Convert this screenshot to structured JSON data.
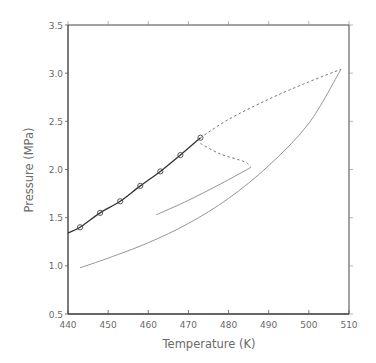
{
  "chart_data": {
    "type": "line",
    "title": "",
    "xlabel": "Temperature (K)",
    "ylabel": "Pressure (MPa)",
    "xlim": [
      440,
      510
    ],
    "ylim": [
      0.5,
      3.5
    ],
    "xticks": [
      440,
      450,
      460,
      470,
      480,
      490,
      500,
      510
    ],
    "yticks": [
      0.5,
      1.0,
      1.5,
      2.0,
      2.5,
      3.0,
      3.5
    ],
    "xtick_labels": [
      "440",
      "450",
      "460",
      "470",
      "480",
      "490",
      "500",
      "510"
    ],
    "ytick_labels": [
      "0.5",
      "1.0",
      "1.5",
      "2.0",
      "2.5",
      "3.0",
      "3.5"
    ],
    "grid": false,
    "legend": null,
    "series": [
      {
        "name": "vapor pressure curve (measured)",
        "style": "solid-thick-with-circle-markers",
        "markers": {
          "x": [
            443,
            448,
            453,
            458,
            463,
            468,
            473
          ],
          "y": [
            1.4,
            1.55,
            1.67,
            1.83,
            1.98,
            2.15,
            2.33
          ]
        },
        "line": {
          "x": [
            440,
            443,
            448,
            453,
            458,
            463,
            468,
            473
          ],
          "y": [
            1.34,
            1.4,
            1.55,
            1.67,
            1.83,
            1.98,
            2.15,
            2.33
          ]
        }
      },
      {
        "name": "upper extrapolation (dashed)",
        "style": "dashed",
        "x": [
          473,
          480,
          490,
          500,
          508
        ],
        "y": [
          2.33,
          2.52,
          2.73,
          2.91,
          3.04
        ]
      },
      {
        "name": "lower branch (dashed)",
        "style": "dashed",
        "x": [
          473,
          478,
          484,
          485.5
        ],
        "y": [
          2.27,
          2.16,
          2.08,
          2.02
        ]
      },
      {
        "name": "inner solid line",
        "style": "solid-thin",
        "x": [
          462,
          470,
          478,
          485.5
        ],
        "y": [
          1.53,
          1.68,
          1.85,
          2.02
        ]
      },
      {
        "name": "outer solid curve",
        "style": "solid-thin",
        "x": [
          443,
          450,
          460,
          470,
          480,
          490,
          500,
          508
        ],
        "y": [
          0.98,
          1.08,
          1.24,
          1.44,
          1.7,
          2.04,
          2.48,
          3.04
        ]
      }
    ]
  },
  "axes": {
    "x_label": "Temperature (K)",
    "y_label": "Pressure (MPa)"
  }
}
